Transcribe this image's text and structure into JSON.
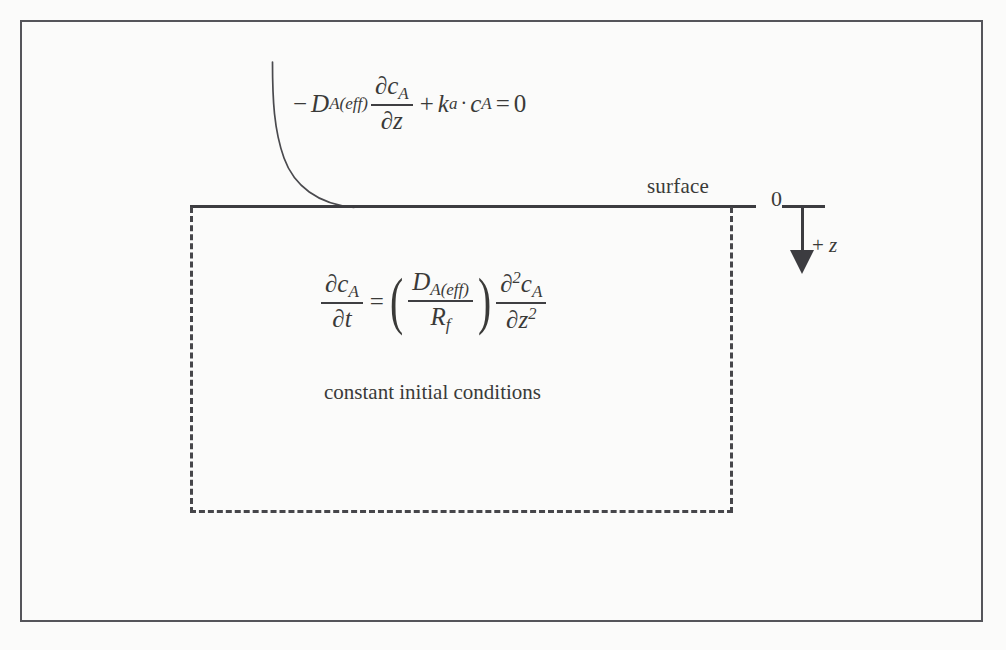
{
  "diagram": {
    "surface_label": "surface",
    "origin_label": "0",
    "depth_axis_label": "+ z",
    "depth_axis_sign": "+",
    "depth_axis_variable": "z",
    "initial_conditions_text": "constant initial conditions",
    "boundary_condition": {
      "full_text": "-D_A(eff) ∂c_A/∂z + k_a · c_A = 0",
      "minus_sign": "−",
      "diffusion_symbol": "D",
      "diffusion_subscript": "A(eff)",
      "flux_numerator_partial": "∂",
      "flux_numerator_var": "c",
      "flux_numerator_sub": "A",
      "flux_denominator_partial": "∂",
      "flux_denominator_var": "z",
      "plus_sign": "+",
      "rate_symbol": "k",
      "rate_subscript": "a",
      "dot": "·",
      "conc_symbol": "c",
      "conc_subscript": "A",
      "equals": "=",
      "rhs": "0"
    },
    "governing_equation": {
      "full_text": "∂c_A/∂t = (D_A(eff)/R_f) ∂²c_A/∂z²",
      "lhs_num_partial": "∂",
      "lhs_num_var": "c",
      "lhs_num_sub": "A",
      "lhs_den_partial": "∂",
      "lhs_den_var": "t",
      "equals": "=",
      "paren_open": "(",
      "paren_close": ")",
      "coef_num_symbol": "D",
      "coef_num_sub": "A(eff)",
      "coef_den_symbol": "R",
      "coef_den_sub": "f",
      "rhs_num_partial": "∂",
      "rhs_num_exp": "2",
      "rhs_num_var": "c",
      "rhs_num_sub": "A",
      "rhs_den_partial": "∂",
      "rhs_den_var": "z",
      "rhs_den_exp": "2"
    },
    "colors": {
      "ink": "#3c3c40",
      "frame": "#55555a",
      "dashed": "#46464a",
      "background": "#fbfbfa"
    }
  }
}
